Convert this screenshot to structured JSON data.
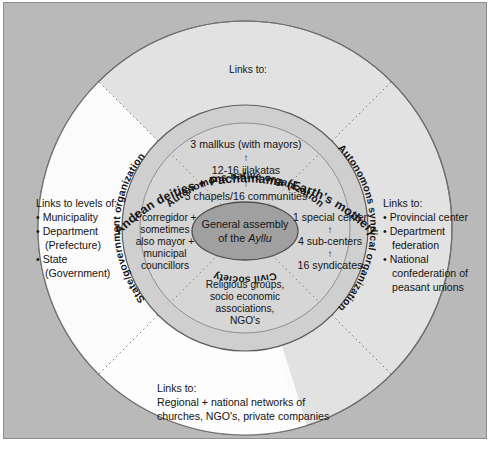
{
  "figure": {
    "type": "concentric-circle-diagram",
    "background_color": "#b9b9b9",
    "frame_border_color": "#8d8d8d"
  },
  "center": {
    "name": "general-assembly",
    "line1": "General assembly",
    "line2_prefix": "of the ",
    "line2_italic": "Ayllu",
    "fill": "#a0a0a0"
  },
  "inner_ring": {
    "fill": "#cfcfcf",
    "sectors": [
      {
        "id": "native",
        "label": "Autonomons native organization",
        "position": "top"
      },
      {
        "id": "syndical",
        "label": "Autonomons syndical organization",
        "position": "right"
      },
      {
        "id": "civil",
        "label": "Civil society",
        "position": "bottom"
      },
      {
        "id": "state",
        "label": "State/government organization",
        "position": "left"
      }
    ]
  },
  "inner_content": {
    "top": {
      "name": "native-organization-content",
      "lines": [
        "3 mallkus (with mayors)",
        "12-16 jilakatas",
        "3 chapels/16 communities"
      ],
      "arrow": "↑"
    },
    "right": {
      "name": "syndical-organization-content",
      "lines": [
        "1 special center",
        "4 sub-centers",
        "16 syndicates"
      ],
      "arrow": "↑"
    },
    "bottom": {
      "name": "civil-society-content",
      "lines": [
        "Religious groups,",
        "socio economic",
        "associations,",
        "NGO's"
      ]
    },
    "left": {
      "name": "state-government-content",
      "lines": [
        "1 corregidor +",
        "sometimes",
        "also mayor +",
        "municipal",
        "councillors"
      ]
    }
  },
  "outer_ring": {
    "fill_top": "#e2e2e2",
    "fill_left": "#fbfbfb",
    "fill_bottom": "#fbfbfb",
    "fill_right": "#e2e2e2",
    "top": {
      "name": "andean-deities-arc",
      "arc_label": "Andean deities + Pachamama (Earth's mother)",
      "links_label": "Links to:"
    },
    "left": {
      "name": "state-links-block",
      "heading": "Links to levels of:",
      "items": [
        "Municipality",
        "Department",
        "(Prefecture)",
        "State",
        "(Government)"
      ]
    },
    "right": {
      "name": "syndical-links-block",
      "heading": "Links to:",
      "items": [
        "Provincial center",
        "Department",
        "federation",
        "National",
        "confederation of",
        "peasant unions"
      ]
    },
    "bottom": {
      "name": "civil-links-block",
      "heading": "Links to:",
      "line1": "Regional + national networks of",
      "line2": "churches, NGO's, private companies"
    }
  }
}
